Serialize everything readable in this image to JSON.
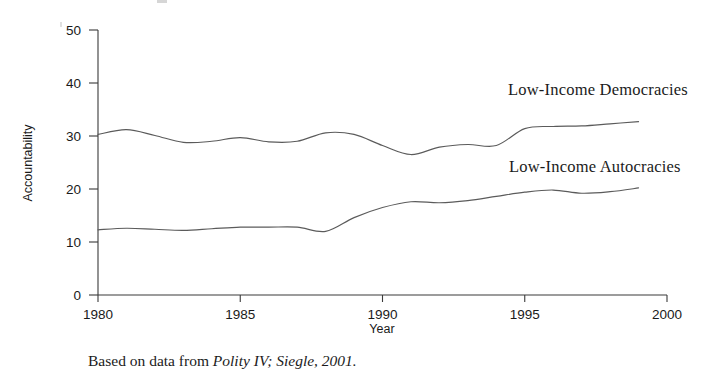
{
  "figure": {
    "caption_prefix": "Based on data from ",
    "caption_source": "Polity IV; Siegle, 2001."
  },
  "chart_data": {
    "type": "line",
    "title": "",
    "xlabel": "Year",
    "ylabel": "Accountability",
    "xlim": [
      1980,
      2000
    ],
    "ylim": [
      0,
      50
    ],
    "xticks": [
      1980,
      1985,
      1990,
      1995,
      2000
    ],
    "yticks": [
      0,
      10,
      20,
      30,
      40,
      50
    ],
    "grid": false,
    "legend_position": "inline-right",
    "line_color": "#5b5b5b",
    "x": [
      1980,
      1981,
      1982,
      1983,
      1984,
      1985,
      1986,
      1987,
      1988,
      1989,
      1990,
      1991,
      1992,
      1993,
      1994,
      1995,
      1996,
      1997,
      1998,
      1999
    ],
    "series": [
      {
        "name": "Low-Income Democracies",
        "label": "Low-Income Democracies",
        "values": [
          30.3,
          31.2,
          30.1,
          28.8,
          29.0,
          29.7,
          28.9,
          29.0,
          30.6,
          30.3,
          28.2,
          26.5,
          27.9,
          28.4,
          28.2,
          31.4,
          31.8,
          31.9,
          32.3,
          32.7
        ]
      },
      {
        "name": "Low-Income Autocracies",
        "label": "Low-Income Autocracies",
        "values": [
          12.3,
          12.6,
          12.4,
          12.2,
          12.5,
          12.8,
          12.8,
          12.8,
          12.0,
          14.6,
          16.5,
          17.6,
          17.4,
          17.8,
          18.6,
          19.4,
          19.8,
          19.2,
          19.5,
          20.2
        ]
      }
    ]
  }
}
